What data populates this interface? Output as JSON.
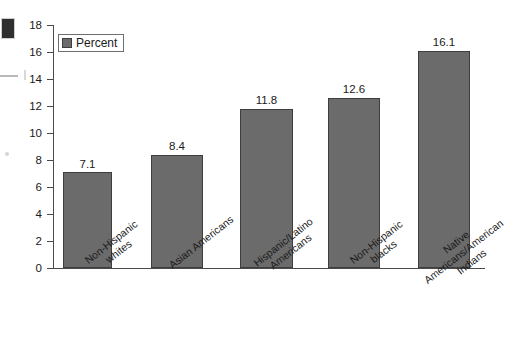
{
  "chart_data": {
    "type": "bar",
    "title": "",
    "subtitle": "",
    "xlabel": "",
    "ylabel": "",
    "categories": [
      "Non-Hispanic\nwhites",
      "Asian Americans",
      "Hispanic/Latino\nAmericans",
      "Non-Hispanic\nblacks",
      "Native\nAmericans/American\nIndians"
    ],
    "values": [
      7.1,
      8.4,
      11.8,
      12.6,
      16.1
    ],
    "value_labels": [
      "7.1",
      "8.4",
      "11.8",
      "12.6",
      "16.1"
    ],
    "series": [
      {
        "name": "Percent",
        "values": [
          7.1,
          8.4,
          11.8,
          12.6,
          16.1
        ]
      }
    ],
    "ylim": [
      0,
      18
    ],
    "yticks": [
      0,
      2,
      4,
      6,
      8,
      10,
      12,
      14,
      16,
      18
    ],
    "ytick_labels": [
      "0",
      "2",
      "4",
      "6",
      "8",
      "10",
      "12",
      "14",
      "16",
      "18"
    ],
    "grid": false,
    "legend": {
      "position": "top-left-inside",
      "entries": [
        {
          "label": "Percent",
          "color": "#6b6b6b"
        }
      ]
    },
    "colors": {
      "bar_fill": "#6b6b6b",
      "bar_edge": "#3e3e3e",
      "axis": "#4a4a4a",
      "text": "#1a1a1a",
      "background": "#ffffff"
    }
  }
}
